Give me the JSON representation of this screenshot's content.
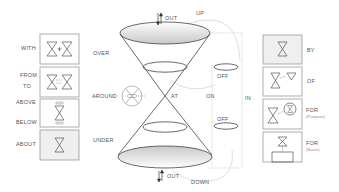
{
  "diagram": {
    "left_labels": {
      "with": "WITH",
      "from": "FROM",
      "to": "TO",
      "above": "ABOVE",
      "below": "BELOW",
      "about": "ABOUT"
    },
    "center_labels": {
      "over": "OVER",
      "around": "AROUND",
      "at": "AT",
      "under": "UNDER",
      "out_top": "OUT",
      "out_bottom": "OUT",
      "up": "UP",
      "down": "DOWN",
      "off_top": "OFF",
      "off_bottom": "OFF",
      "on": "ON",
      "in": "IN"
    },
    "right_labels": {
      "by": "BY",
      "of": "OF",
      "for_purpose": "FOR",
      "for_purpose_sub": "(Purpose)",
      "for_basis": "FOR",
      "for_basis_sub": "(Basis)"
    },
    "colors": {
      "line": "#444444",
      "box_border": "#9a9a9a",
      "box_fill": "#efefef",
      "dashed": "#b0b0b0",
      "label": "#555555"
    }
  }
}
